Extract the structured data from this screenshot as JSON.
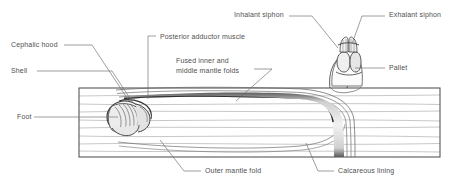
{
  "figure": {
    "ink_color": "#4f4f4f",
    "line_color": "#6b6b6b",
    "background": "#ffffff"
  },
  "labels": [
    {
      "id": "cephalic-hood",
      "text": "Cephalic hood",
      "x": 11,
      "y": 44
    },
    {
      "id": "shell",
      "text": "Shell",
      "x": 11,
      "y": 70
    },
    {
      "id": "foot",
      "text": "Foot",
      "x": 17,
      "y": 116
    },
    {
      "id": "posterior-adductor",
      "text": "Posterior adductor muscle",
      "x": 160,
      "y": 36
    },
    {
      "id": "fused-folds-line1",
      "text": "Fused inner and",
      "x": 176,
      "y": 60
    },
    {
      "id": "fused-folds-line2",
      "text": "middle mantle folds",
      "x": 176,
      "y": 70
    },
    {
      "id": "inhalant-siphon",
      "text": "Inhalant siphon",
      "x": 234,
      "y": 13
    },
    {
      "id": "exhalant-siphon",
      "text": "Exhalant siphon",
      "x": 389,
      "y": 13
    },
    {
      "id": "pallet",
      "text": "Pallet",
      "x": 389,
      "y": 66
    },
    {
      "id": "outer-mantle-fold",
      "text": "Outer mantle fold",
      "x": 205,
      "y": 170
    },
    {
      "id": "calcareous-lining",
      "text": "Calcareous lining",
      "x": 338,
      "y": 170
    }
  ],
  "plank": {
    "left": 79,
    "top": 88,
    "right": 440,
    "bottom": 157
  }
}
